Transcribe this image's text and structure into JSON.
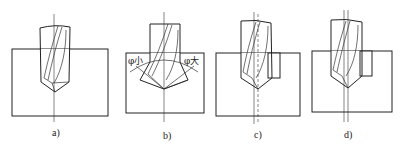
{
  "figure": {
    "panels": [
      {
        "id": "a",
        "caption": "a)"
      },
      {
        "id": "b",
        "caption": "b)",
        "angle_labels": {
          "left": "φ小",
          "right": "φ大"
        }
      },
      {
        "id": "c",
        "caption": "c)"
      },
      {
        "id": "d",
        "caption": "d)"
      }
    ]
  },
  "colors": {
    "line": "#222222",
    "background": "#ffffff"
  }
}
